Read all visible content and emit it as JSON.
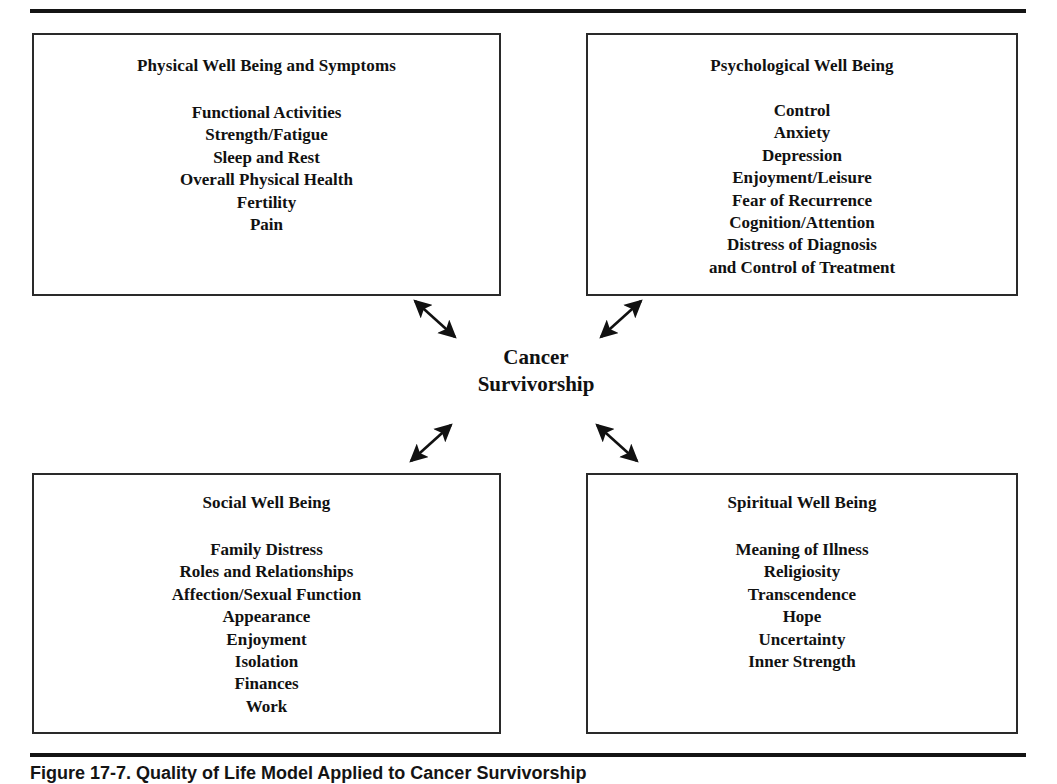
{
  "figure": {
    "caption": "Figure 17-7. Quality of Life Model Applied to Cancer Survivorship",
    "center_line1": "Cancer",
    "center_line2": "Survivorship"
  },
  "quadrants": {
    "physical": {
      "title": "Physical Well Being and Symptoms",
      "items": [
        "Functional Activities",
        "Strength/Fatigue",
        "Sleep and Rest",
        "Overall Physical Health",
        "Fertility",
        "Pain"
      ]
    },
    "psychological": {
      "title": "Psychological Well Being",
      "items": [
        "Control",
        "Anxiety",
        "Depression",
        "Enjoyment/Leisure",
        "Fear of Recurrence",
        "Cognition/Attention",
        "Distress of Diagnosis",
        "and Control of Treatment"
      ]
    },
    "social": {
      "title": "Social Well Being",
      "items": [
        "Family Distress",
        "Roles and Relationships",
        "Affection/Sexual Function",
        "Appearance",
        "Enjoyment",
        "Isolation",
        "Finances",
        "Work"
      ]
    },
    "spiritual": {
      "title": "Spiritual Well Being",
      "items": [
        "Meaning of Illness",
        "Religiosity",
        "Transcendence",
        "Hope",
        "Uncertainty",
        "Inner Strength"
      ]
    }
  },
  "connectors": [
    {
      "name": "arrow-upper-left",
      "style": "double-headed"
    },
    {
      "name": "arrow-upper-right",
      "style": "double-headed"
    },
    {
      "name": "arrow-lower-left",
      "style": "double-headed"
    },
    {
      "name": "arrow-lower-right",
      "style": "double-headed"
    }
  ],
  "colors": {
    "ink": "#141414",
    "box_border": "#2a2a2a",
    "page": "#ffffff"
  }
}
